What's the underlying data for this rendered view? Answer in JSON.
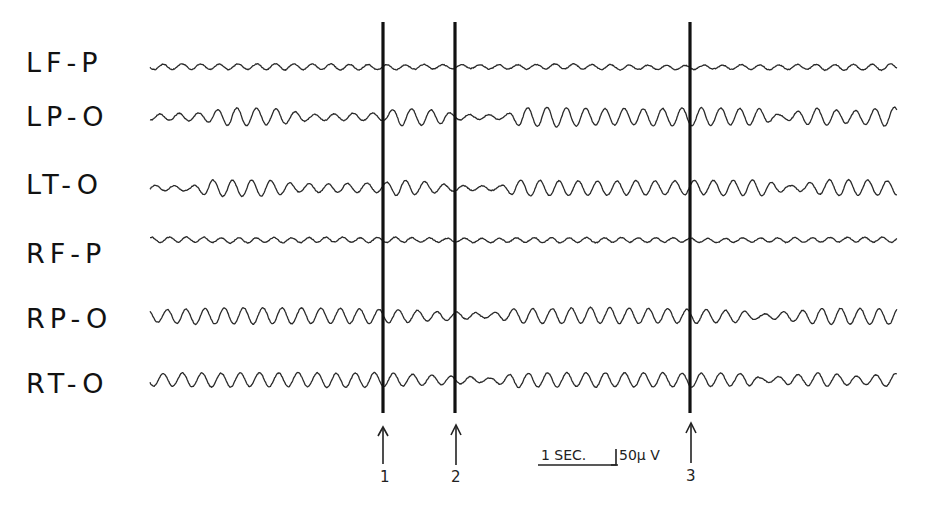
{
  "chart_data": {
    "type": "line",
    "title": "",
    "xlabel": "",
    "ylabel": "",
    "grid": false,
    "legend": "none",
    "x_range_px": [
      150,
      897
    ],
    "channels": [
      {
        "name": "LF-P",
        "baseline_y": 67,
        "freq": 0.28,
        "envelope": [
          [
            150,
            2.5
          ],
          [
            300,
            3
          ],
          [
            383,
            2.5
          ],
          [
            455,
            2
          ],
          [
            600,
            2.5
          ],
          [
            690,
            2
          ],
          [
            897,
            3
          ]
        ]
      },
      {
        "name": "LP-O",
        "baseline_y": 117,
        "freq": 0.27,
        "envelope": [
          [
            150,
            3
          ],
          [
            200,
            4
          ],
          [
            230,
            9
          ],
          [
            280,
            8
          ],
          [
            310,
            3
          ],
          [
            383,
            4
          ],
          [
            400,
            9
          ],
          [
            440,
            7
          ],
          [
            455,
            3
          ],
          [
            505,
            2
          ],
          [
            520,
            9
          ],
          [
            560,
            10
          ],
          [
            600,
            8
          ],
          [
            690,
            9
          ],
          [
            760,
            8
          ],
          [
            780,
            2
          ],
          [
            815,
            9
          ],
          [
            850,
            6
          ],
          [
            897,
            10
          ]
        ]
      },
      {
        "name": "LT-O",
        "baseline_y": 188,
        "freq": 0.27,
        "envelope": [
          [
            150,
            3
          ],
          [
            190,
            2
          ],
          [
            210,
            8
          ],
          [
            270,
            8
          ],
          [
            300,
            4
          ],
          [
            383,
            5
          ],
          [
            400,
            8
          ],
          [
            455,
            3
          ],
          [
            500,
            2
          ],
          [
            515,
            8
          ],
          [
            600,
            7
          ],
          [
            690,
            7
          ],
          [
            760,
            8
          ],
          [
            790,
            2
          ],
          [
            830,
            8
          ],
          [
            897,
            7
          ]
        ]
      },
      {
        "name": "RF-P",
        "baseline_y": 240,
        "freq": 0.3,
        "envelope": [
          [
            150,
            2.5
          ],
          [
            383,
            2.5
          ],
          [
            455,
            2
          ],
          [
            600,
            2.5
          ],
          [
            690,
            2
          ],
          [
            897,
            2.5
          ]
        ]
      },
      {
        "name": "RP-O",
        "baseline_y": 316,
        "freq": 0.27,
        "envelope": [
          [
            150,
            6
          ],
          [
            200,
            8
          ],
          [
            300,
            8
          ],
          [
            383,
            7
          ],
          [
            455,
            4
          ],
          [
            490,
            2
          ],
          [
            515,
            7
          ],
          [
            600,
            8
          ],
          [
            690,
            7
          ],
          [
            740,
            6
          ],
          [
            760,
            2
          ],
          [
            820,
            8
          ],
          [
            897,
            8
          ]
        ]
      },
      {
        "name": "RT-O",
        "baseline_y": 380,
        "freq": 0.27,
        "envelope": [
          [
            150,
            6
          ],
          [
            200,
            7
          ],
          [
            300,
            7
          ],
          [
            383,
            7
          ],
          [
            455,
            4
          ],
          [
            490,
            2
          ],
          [
            515,
            7
          ],
          [
            600,
            7
          ],
          [
            690,
            7
          ],
          [
            750,
            6
          ],
          [
            760,
            2
          ],
          [
            820,
            7
          ],
          [
            860,
            4
          ],
          [
            897,
            7
          ]
        ]
      }
    ],
    "markers": [
      {
        "label": "1",
        "x": 383
      },
      {
        "label": "2",
        "x": 455
      },
      {
        "label": "3",
        "x": 690
      }
    ],
    "calibration": {
      "time_label": "1 SEC.",
      "voltage_label": "50μ V"
    }
  },
  "labels": {
    "lfp": "LF-P",
    "lpo": "LP-O",
    "lto": "LT-O",
    "rfp": "RF-P",
    "rpo": "RP-O",
    "rto": "RT-O"
  },
  "markers": {
    "m1": "1",
    "m2": "2",
    "m3": "3"
  },
  "scale": {
    "time": "1 SEC.",
    "voltage": "50μ V"
  },
  "colors": {
    "ink": "#1a1a1a",
    "trace": "#2a2a2a",
    "background": "#ffffff"
  }
}
